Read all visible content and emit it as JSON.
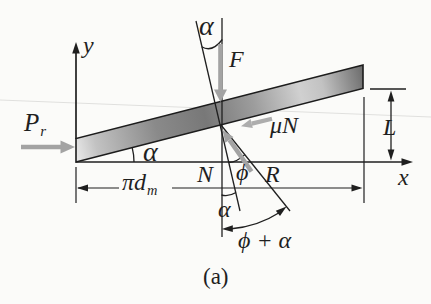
{
  "figure": {
    "caption": "(a)",
    "axes": {
      "x_label": "x",
      "y_label": "y"
    },
    "forces": {
      "load": "F",
      "effort_main": "P",
      "effort_sub": "r",
      "friction": "μN",
      "normal": "N",
      "resultant": "R"
    },
    "angles": {
      "lead_top": "α",
      "lead_base": "α",
      "lead_small": "α",
      "friction_angle": "ϕ",
      "total": "ϕ + α"
    },
    "dimensions": {
      "lead_height": "L",
      "circumference_main": "πd",
      "circumference_sub": "m"
    },
    "colors": {
      "ink": "#1f1f1f",
      "arrow_gray": "#a3a3a3",
      "bar_dark": "#787878",
      "bar_light": "#d6d6d6",
      "background": "#fbfbf9"
    }
  }
}
